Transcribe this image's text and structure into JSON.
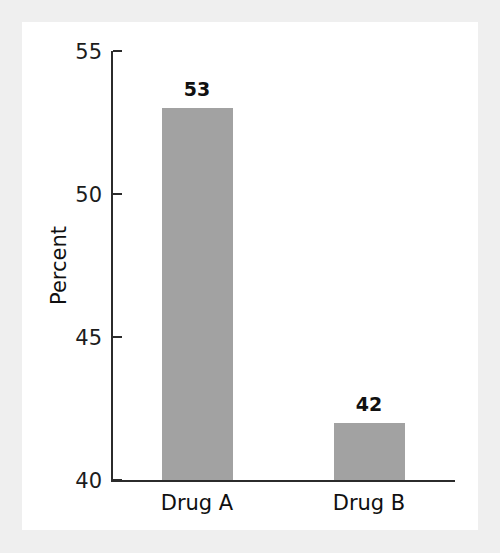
{
  "figure": {
    "background_color": "#efefef",
    "panel_color": "#ffffff",
    "bar_color": "#a2a2a2",
    "axis_color": "#2b2b2b"
  },
  "chart_data": {
    "type": "bar",
    "title": "",
    "xlabel": "",
    "ylabel": "Percent",
    "categories": [
      "Drug A",
      "Drug B"
    ],
    "values": [
      53,
      42
    ],
    "value_labels": [
      "53",
      "42"
    ],
    "ylim": [
      40,
      55
    ],
    "yticks": [
      40,
      45,
      50,
      55
    ],
    "ytick_labels": [
      "40",
      "45",
      "50",
      "55"
    ],
    "grid": false,
    "legend": false,
    "series": [
      {
        "name": "Percent",
        "values": [
          53,
          42
        ]
      }
    ]
  }
}
